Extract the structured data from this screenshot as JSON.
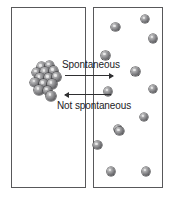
{
  "diagram": {
    "type": "particle-diffusion-diagram",
    "canvas": {
      "width": 172,
      "height": 200,
      "background": "#ffffff"
    },
    "colors": {
      "box_border": "#58585a",
      "sphere_dark": "#3d3d40",
      "sphere_mid": "#7c7c7f",
      "sphere_light": "#d6d6d6",
      "arrow": "#2f2f31",
      "text": "#1c1c1e"
    },
    "boxes": [
      {
        "id": "left",
        "name": "left-chamber",
        "x": 11,
        "y": 7,
        "width": 75,
        "height": 181,
        "particle_count": 14,
        "state": "compressed-clustered"
      },
      {
        "id": "right",
        "name": "right-chamber",
        "x": 93,
        "y": 7,
        "width": 70,
        "height": 181,
        "particle_count": 13,
        "state": "dispersed-scattered"
      }
    ],
    "arrows": [
      {
        "id": "forward",
        "name": "spontaneous-arrow",
        "label": "Spontaneous",
        "direction": "right",
        "x": 65,
        "y": 75,
        "length": 48,
        "label_x": 62,
        "label_y": 59
      },
      {
        "id": "reverse",
        "name": "not-spontaneous-arrow",
        "label": "Not spontaneous",
        "direction": "left",
        "x": 65,
        "y": 94,
        "length": 46,
        "label_x": 57,
        "label_y": 100
      }
    ],
    "left_particles": [
      {
        "cx": 41.5,
        "cy": 67.0,
        "r": 4.6
      },
      {
        "cx": 49.5,
        "cy": 65.5,
        "r": 4.6
      },
      {
        "cx": 36.5,
        "cy": 72.5,
        "r": 4.6
      },
      {
        "cx": 45.0,
        "cy": 72.0,
        "r": 4.6
      },
      {
        "cx": 53.5,
        "cy": 71.0,
        "r": 4.6
      },
      {
        "cx": 40.0,
        "cy": 78.0,
        "r": 4.6
      },
      {
        "cx": 48.5,
        "cy": 78.0,
        "r": 4.6
      },
      {
        "cx": 56.5,
        "cy": 77.0,
        "r": 4.6
      },
      {
        "cx": 35.0,
        "cy": 82.5,
        "r": 4.6
      },
      {
        "cx": 43.5,
        "cy": 84.0,
        "r": 4.6
      },
      {
        "cx": 52.0,
        "cy": 84.0,
        "r": 4.6
      },
      {
        "cx": 39.0,
        "cy": 90.0,
        "r": 4.6
      },
      {
        "cx": 47.5,
        "cy": 90.5,
        "r": 4.6
      },
      {
        "cx": 51.0,
        "cy": 96.0,
        "r": 4.6
      }
    ],
    "right_particles": [
      {
        "cx": 145.0,
        "cy": 19.0,
        "r": 4.3
      },
      {
        "cx": 115.5,
        "cy": 27.0,
        "r": 4.3
      },
      {
        "cx": 153.0,
        "cy": 38.5,
        "r": 4.3
      },
      {
        "cx": 105.5,
        "cy": 55.5,
        "r": 4.3
      },
      {
        "cx": 135.5,
        "cy": 71.5,
        "r": 4.3
      },
      {
        "cx": 108.0,
        "cy": 91.5,
        "r": 4.3
      },
      {
        "cx": 153.0,
        "cy": 89.0,
        "r": 4.3
      },
      {
        "cx": 144.0,
        "cy": 117.0,
        "r": 4.3
      },
      {
        "cx": 118.0,
        "cy": 129.0,
        "r": 4.3
      },
      {
        "cx": 119.5,
        "cy": 131.0,
        "r": 4.3
      },
      {
        "cx": 97.5,
        "cy": 145.0,
        "r": 4.3
      },
      {
        "cx": 111.0,
        "cy": 171.5,
        "r": 4.3
      },
      {
        "cx": 146.0,
        "cy": 171.5,
        "r": 4.3
      }
    ]
  }
}
